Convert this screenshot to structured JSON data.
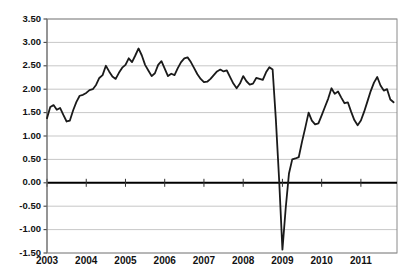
{
  "chart_data": {
    "type": "line",
    "title": "",
    "xlabel": "",
    "ylabel": "",
    "ylim": [
      -1.5,
      3.5
    ],
    "ytick_labels": [
      "3.50",
      "3.00",
      "2.50",
      "2.00",
      "1.50",
      "1.00",
      "0.50",
      "0.00",
      "-0.50",
      "-1.00",
      "-1.50"
    ],
    "ytick_values": [
      3.5,
      3.0,
      2.5,
      2.0,
      1.5,
      1.0,
      0.5,
      0.0,
      -0.5,
      -1.0,
      -1.5
    ],
    "xtick_labels": [
      "2003",
      "2004",
      "2005",
      "2006",
      "2007",
      "2008",
      "2009",
      "2010",
      "2011"
    ],
    "xtick_values": [
      2003,
      2004,
      2005,
      2006,
      2007,
      2008,
      2009,
      2010,
      2011
    ],
    "xlim": [
      2003,
      2011.92
    ],
    "grid": true,
    "grid_axis": "y",
    "legend": "none",
    "zero_line_emphasized": true,
    "line_color": "#1a1a1a",
    "grid_color": "#b9b9b9",
    "series": [
      {
        "name": "series-1",
        "x": [
          2003.0,
          2003.083,
          2003.167,
          2003.25,
          2003.333,
          2003.417,
          2003.5,
          2003.583,
          2003.667,
          2003.75,
          2003.833,
          2003.917,
          2004.0,
          2004.083,
          2004.167,
          2004.25,
          2004.333,
          2004.417,
          2004.5,
          2004.583,
          2004.667,
          2004.75,
          2004.833,
          2004.917,
          2005.0,
          2005.083,
          2005.167,
          2005.25,
          2005.333,
          2005.417,
          2005.5,
          2005.583,
          2005.667,
          2005.75,
          2005.833,
          2005.917,
          2006.0,
          2006.083,
          2006.167,
          2006.25,
          2006.333,
          2006.417,
          2006.5,
          2006.583,
          2006.667,
          2006.75,
          2006.833,
          2006.917,
          2007.0,
          2007.083,
          2007.167,
          2007.25,
          2007.333,
          2007.417,
          2007.5,
          2007.583,
          2007.667,
          2007.75,
          2007.833,
          2007.917,
          2008.0,
          2008.083,
          2008.167,
          2008.25,
          2008.333,
          2008.417,
          2008.5,
          2008.583,
          2008.667,
          2008.75,
          2008.833,
          2008.917,
          2009.0,
          2009.083,
          2009.167,
          2009.25,
          2009.333,
          2009.417,
          2009.5,
          2009.583,
          2009.667,
          2009.75,
          2009.833,
          2009.917,
          2010.0,
          2010.083,
          2010.167,
          2010.25,
          2010.333,
          2010.417,
          2010.5,
          2010.583,
          2010.667,
          2010.75,
          2010.833,
          2010.917,
          2011.0,
          2011.083,
          2011.167,
          2011.25,
          2011.333,
          2011.417,
          2011.5,
          2011.583,
          2011.667,
          2011.75,
          2011.833
        ],
        "values": [
          1.38,
          1.62,
          1.66,
          1.56,
          1.6,
          1.45,
          1.31,
          1.33,
          1.55,
          1.73,
          1.86,
          1.88,
          1.92,
          1.98,
          2.0,
          2.09,
          2.24,
          2.3,
          2.5,
          2.38,
          2.27,
          2.22,
          2.35,
          2.46,
          2.52,
          2.66,
          2.58,
          2.72,
          2.87,
          2.72,
          2.52,
          2.4,
          2.28,
          2.34,
          2.52,
          2.6,
          2.44,
          2.28,
          2.33,
          2.3,
          2.45,
          2.58,
          2.66,
          2.68,
          2.58,
          2.45,
          2.32,
          2.22,
          2.15,
          2.16,
          2.22,
          2.3,
          2.38,
          2.42,
          2.38,
          2.4,
          2.26,
          2.12,
          2.02,
          2.12,
          2.28,
          2.17,
          2.1,
          2.12,
          2.24,
          2.22,
          2.2,
          2.36,
          2.47,
          2.42,
          1.35,
          0.05,
          -1.43,
          -0.55,
          0.2,
          0.5,
          0.52,
          0.55,
          0.88,
          1.18,
          1.5,
          1.33,
          1.25,
          1.27,
          1.44,
          1.62,
          1.8,
          2.02,
          1.9,
          1.95,
          1.82,
          1.7,
          1.72,
          1.52,
          1.34,
          1.23,
          1.33,
          1.52,
          1.74,
          1.96,
          2.14,
          2.26,
          2.08,
          1.97,
          2.0,
          1.78,
          1.72
        ],
        "min": -1.43,
        "max": 2.87,
        "start_value": 1.38,
        "end_value": 1.72
      }
    ],
    "annotations": [
      {
        "label": "crash-trough",
        "x": 2009.0,
        "y": -1.43
      },
      {
        "label": "peak",
        "x": 2005.333,
        "y": 2.87
      }
    ]
  },
  "axes": {
    "plot_left_px": 47,
    "plot_right_px": 397,
    "plot_top_px": 19,
    "plot_bottom_px": 253
  }
}
